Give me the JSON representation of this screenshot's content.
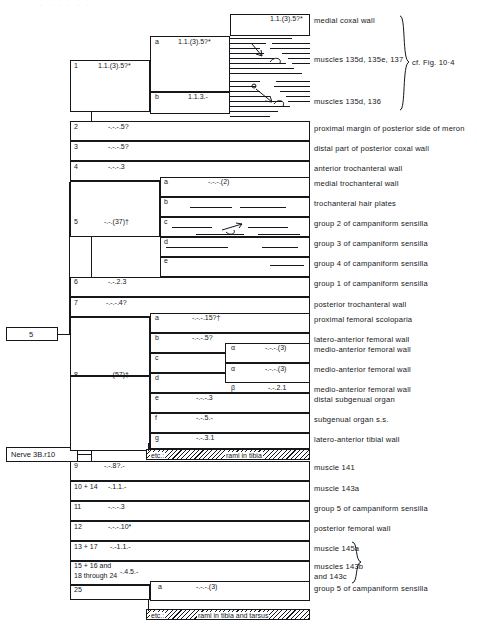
{
  "figure": {
    "root_label": "Nerve 3B.r10",
    "node5_label": "5",
    "cf_note": "cf. Fig. 10·4",
    "top_strip": ". . . .  .    .",
    "etc_tibia": "rami in tibia",
    "etc_tibia_tarsus": "rami in tibia and tarsus",
    "etc_caption": "etc.:"
  },
  "branches": [
    {
      "id": "1",
      "number": "1",
      "formula": "1.1.(3).5?*",
      "subs": [
        {
          "letter": "a",
          "formula": "1.1.(3).5?*",
          "terminals": [
            "medial coxal wall",
            "muscles 135d, 135e, 137"
          ]
        },
        {
          "letter": "b",
          "formula": "1.1.3.-",
          "terminals": [
            "muscles 135d, 136"
          ]
        }
      ]
    },
    {
      "id": "2",
      "number": "2",
      "formula": "-.-.-.5?",
      "terminal": "proximal margin of posterior side of meron"
    },
    {
      "id": "3",
      "number": "3",
      "formula": "-.-.-.5?",
      "terminal": "distal part of posterior coxal wall"
    },
    {
      "id": "4",
      "number": "4",
      "formula": "-.-.-.3",
      "terminal": "anterior trochanteral wall"
    },
    {
      "id": "5",
      "number": "5",
      "formula": "-.-.(37)†",
      "subs": [
        {
          "letter": "a",
          "formula": "-.-.-.(2)",
          "terminal": "medial trochanteral wall"
        },
        {
          "letter": "b",
          "formula": "",
          "terminal": "trochanteral hair plates"
        },
        {
          "letter": "c",
          "formula": "",
          "terminal": "group 2 of campaniform sensilla"
        },
        {
          "letter": "d",
          "formula": "",
          "terminal": "group 3 of campaniform sensilla"
        },
        {
          "letter": "e",
          "formula": "",
          "terminal": "group 4 of campaniform sensilla"
        }
      ]
    },
    {
      "id": "6",
      "number": "6",
      "formula": "-.-.2.3",
      "terminal": "group 1 of campaniform sensilla"
    },
    {
      "id": "7",
      "number": "7",
      "formula": "-.-.-.4?",
      "terminal": "posterior trochanteral wall"
    },
    {
      "id": "8",
      "number": "8",
      "formula": "-.-.(57)†",
      "subs": [
        {
          "letter": "a",
          "formula": "-.-.-.15?†",
          "terminal": "proximal femoral scoloparia"
        },
        {
          "letter": "b",
          "formula": "-.-.-.5?",
          "terminal": "latero-anterior femoral wall"
        },
        {
          "letter": "c",
          "formula": "",
          "greeks": [
            {
              "mark": "α",
              "formula": "-.-.-.(3)",
              "terminal": "medio-anterior femoral wall"
            },
            {
              "mark": "β",
              "formula": "-.-.-.4",
              "terminal": "medio-anterior femoral wall"
            }
          ]
        },
        {
          "letter": "d",
          "formula": "",
          "greeks": [
            {
              "mark": "α",
              "formula": "-.-.-.(3)",
              "terminal": "latero-anterior femoral wall"
            },
            {
              "mark": "β",
              "formula": "-.-.2.1",
              "terminal": "medio-anterior femoral wall"
            }
          ]
        },
        {
          "letter": "e",
          "formula": "-.-.-.3",
          "terminal": "distal subgenual organ"
        },
        {
          "letter": "f",
          "formula": "-.-.5.-",
          "terminal": "subgenual organ s.s."
        },
        {
          "letter": "g",
          "formula": "-.-.3.1",
          "terminal": "latero-anterior tibial wall"
        }
      ]
    },
    {
      "id": "9",
      "number": "9",
      "formula": "-.-.8?.-",
      "terminal": "muscle 141"
    },
    {
      "id": "10",
      "number": "10 + 14",
      "formula": "-.1.1.-",
      "terminal": "muscle 143a"
    },
    {
      "id": "11",
      "number": "11",
      "formula": "-.-.-.3",
      "terminal": "group 5 of campaniform sensilla"
    },
    {
      "id": "12",
      "number": "12",
      "formula": "-.-.-.10*",
      "terminal": "posterior femoral wall"
    },
    {
      "id": "13",
      "number": "13 + 17",
      "formula": "-.-1.1.-",
      "terminal": "muscle 145a"
    },
    {
      "id": "15",
      "number": "15 + 16 and",
      "number2": "18 through 24",
      "formula": "-.4.5.-",
      "terminal": "muscles 143b",
      "terminal2": "and 143c"
    },
    {
      "id": "25",
      "number": "25",
      "formula": "",
      "subs": [
        {
          "letter": "a",
          "formula": "-.-.-.(3)",
          "terminal": "group 5 of campaniform sensilla"
        }
      ]
    }
  ]
}
